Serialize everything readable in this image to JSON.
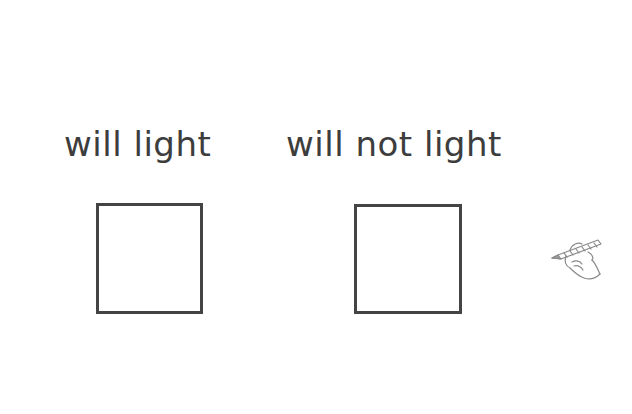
{
  "worksheet": {
    "categories": [
      {
        "label": "will light",
        "answer": ""
      },
      {
        "label": "will not light",
        "answer": ""
      }
    ],
    "decoration": "hand-writing-with-pencil-icon"
  }
}
